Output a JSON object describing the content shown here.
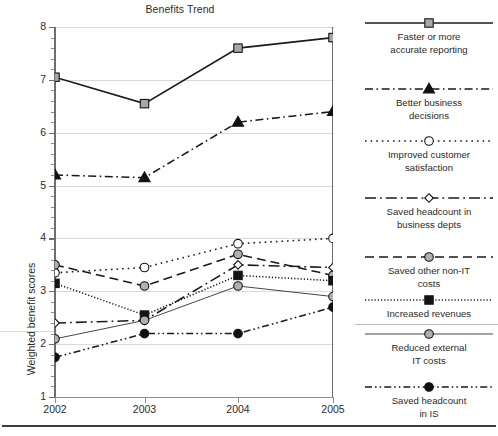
{
  "chart_data": {
    "type": "line",
    "title": "Benefits Trend",
    "xlabel": "",
    "ylabel": "Weighted benefit scores",
    "categories": [
      "2002",
      "2003",
      "2004",
      "2005"
    ],
    "x": [
      2002,
      2003,
      2004,
      2005
    ],
    "xlim": [
      2002,
      2005
    ],
    "ylim": [
      1,
      8
    ],
    "yticks": [
      1,
      2,
      3,
      4,
      5,
      6,
      7,
      8
    ],
    "ytick_labels": [
      "1",
      "2",
      "3",
      "4",
      "5",
      "6",
      "7",
      "8"
    ],
    "grid": "horizontal major gridlines at integer values",
    "legend_position": "right",
    "series": [
      {
        "name": "Faster or more accurate reporting",
        "values": [
          7.05,
          6.55,
          7.6,
          7.8
        ],
        "line_style": "solid",
        "marker": "square",
        "marker_fill": "#a8a8a8",
        "color": "#1a1a1a"
      },
      {
        "name": "Better business decisions",
        "values": [
          5.2,
          5.15,
          6.2,
          6.4
        ],
        "line_style": "dash-dot",
        "marker": "triangle",
        "marker_fill": "#111111",
        "color": "#1a1a1a"
      },
      {
        "name": "Improved customer satisfaction",
        "values": [
          3.35,
          3.45,
          3.9,
          4.0
        ],
        "line_style": "dotted",
        "marker": "circle-open",
        "marker_fill": "#ffffff",
        "color": "#1a1a1a"
      },
      {
        "name": "Saved headcount in business depts",
        "values": [
          2.4,
          2.45,
          3.5,
          3.45
        ],
        "line_style": "long-dash-dot",
        "marker": "diamond-open",
        "marker_fill": "#ffffff",
        "color": "#1a1a1a"
      },
      {
        "name": "Saved other non-IT costs",
        "values": [
          3.5,
          3.1,
          3.7,
          3.3
        ],
        "line_style": "dashed",
        "marker": "circle",
        "marker_fill": "#b0b0b0",
        "color": "#1a1a1a"
      },
      {
        "name": "Increased revenues",
        "values": [
          3.15,
          2.55,
          3.3,
          3.2
        ],
        "line_style": "fine-dotted",
        "marker": "square",
        "marker_fill": "#141414",
        "color": "#1a1a1a"
      },
      {
        "name": "Reduced external IT costs",
        "values": [
          2.1,
          2.45,
          3.1,
          2.9
        ],
        "line_style": "solid-thin",
        "marker": "circle",
        "marker_fill": "#b0b0b0",
        "color": "#3c3c3c"
      },
      {
        "name": "Saved headcount in IS",
        "values": [
          1.75,
          2.2,
          2.2,
          2.7
        ],
        "line_style": "dash-dot-dot",
        "marker": "circle",
        "marker_fill": "#111111",
        "color": "#1a1a1a"
      }
    ]
  },
  "chart": {
    "title": "Benefits Trend",
    "y_axis_title": "Weighted benefit scores",
    "y_tick_labels": [
      "8",
      "7",
      "6",
      "5",
      "4",
      "3",
      "2",
      "1"
    ],
    "x_tick_labels": [
      "2002",
      "2003",
      "2004",
      "2005"
    ]
  },
  "legend": {
    "items": [
      {
        "label_line_1": "Faster or more",
        "label_line_2": "accurate reporting",
        "marker": "square-gray-icon"
      },
      {
        "label_line_1": "Better business",
        "label_line_2": "decisions",
        "marker": "triangle-black-icon"
      },
      {
        "label_line_1": "Improved customer",
        "label_line_2": "satisfaction",
        "marker": "circle-open-icon"
      },
      {
        "label_line_1": "Saved headcount in",
        "label_line_2": "business depts",
        "marker": "diamond-open-icon"
      },
      {
        "label_line_1": "Saved other non-IT",
        "label_line_2": "costs",
        "marker": "circle-gray-icon"
      },
      {
        "label_line_1": "Increased revenues",
        "label_line_2": "",
        "marker": "square-black-icon"
      },
      {
        "label_line_1": "Reduced external",
        "label_line_2": "IT costs",
        "marker": "circle-gray-icon"
      },
      {
        "label_line_1": "Saved headcount",
        "label_line_2": "in IS",
        "marker": "circle-black-icon"
      }
    ]
  },
  "colors": {
    "axis": "#6e6e6e",
    "grid": "#d9d9d9",
    "text": "#2b2b2b",
    "line": "#1a1a1a",
    "marker_gray": "#a8a8a8",
    "marker_black": "#141414"
  }
}
